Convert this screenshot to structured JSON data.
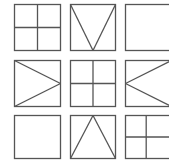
{
  "puzzle": {
    "title": "3x3 figure matrix",
    "stroke_color": "#555555",
    "background": "#ffffff",
    "cells": [
      {
        "row": 0,
        "col": 0,
        "x": 14,
        "y": 4,
        "w": 46,
        "h": 46,
        "pattern": "quad-cross"
      },
      {
        "row": 0,
        "col": 1,
        "x": 70,
        "y": 4,
        "w": 45,
        "h": 46,
        "pattern": "triangle-down"
      },
      {
        "row": 0,
        "col": 2,
        "x": 125,
        "y": 4,
        "w": 46,
        "h": 46,
        "pattern": "empty"
      },
      {
        "row": 1,
        "col": 0,
        "x": 14,
        "y": 60,
        "w": 46,
        "h": 46,
        "pattern": "triangle-right"
      },
      {
        "row": 1,
        "col": 1,
        "x": 70,
        "y": 60,
        "w": 45,
        "h": 46,
        "pattern": "quad-cross"
      },
      {
        "row": 1,
        "col": 2,
        "x": 125,
        "y": 60,
        "w": 46,
        "h": 46,
        "pattern": "triangle-left"
      },
      {
        "row": 2,
        "col": 0,
        "x": 14,
        "y": 115,
        "w": 46,
        "h": 43,
        "pattern": "empty"
      },
      {
        "row": 2,
        "col": 1,
        "x": 70,
        "y": 115,
        "w": 45,
        "h": 43,
        "pattern": "triangle-up"
      },
      {
        "row": 2,
        "col": 2,
        "x": 125,
        "y": 115,
        "w": 46,
        "h": 43,
        "pattern": "quad-cross-offset"
      }
    ]
  }
}
